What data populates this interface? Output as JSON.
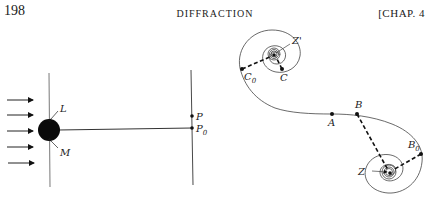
{
  "header": {
    "page_number": "198",
    "running_title": "DIFFRACTION",
    "chapter": "[CHAP. 4"
  },
  "figure_left": {
    "description": "Plane wave incident on opaque sphere, observation screen",
    "labels": {
      "L": "L",
      "M": "M",
      "P": "P",
      "P0": "P",
      "P0_sub": "0"
    },
    "incident_arrows": 5
  },
  "figure_right": {
    "description": "Cornu spiral with points",
    "labels": {
      "Zp": "Z'",
      "C0": "C",
      "C0_sub": "0",
      "C": "C",
      "A": "A",
      "B": "B",
      "B0": "B",
      "B0_sub": "0",
      "Z": "Z"
    }
  }
}
